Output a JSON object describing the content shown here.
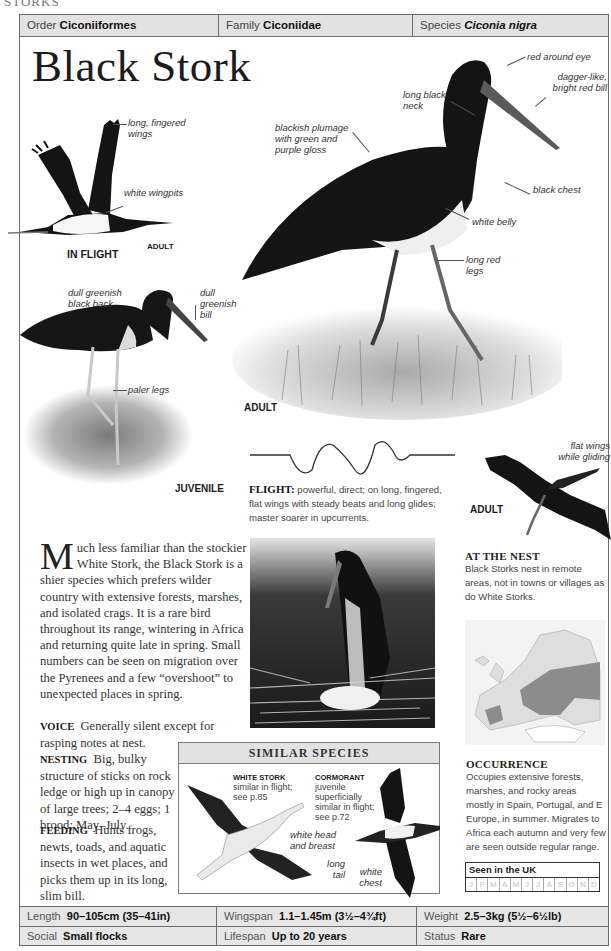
{
  "running_head": "STORKS",
  "header": {
    "order_label": "Order",
    "order_value": "Ciconiiformes",
    "family_label": "Family",
    "family_value": "Ciconiidae",
    "species_label": "Species",
    "species_value": "Ciconia nigra"
  },
  "title": "Black Stork",
  "in_flight": {
    "caption": "IN FLIGHT",
    "age": "ADULT",
    "labels": [
      "long, fingered wings",
      "white wingpits"
    ]
  },
  "adult_main": {
    "caption": "ADULT",
    "labels": {
      "eye": "red around eye",
      "bill": "dagger-like, bright red bill",
      "neck": "long black neck",
      "plumage": "blackish plumage with green and purple gloss",
      "chest": "black chest",
      "belly": "white belly",
      "legs": "long red legs"
    }
  },
  "juvenile": {
    "caption": "JUVENILE",
    "labels": {
      "back": "dull greenish black back",
      "bill": "dull greenish bill",
      "legs": "paler legs"
    }
  },
  "flight": {
    "heading": "FLIGHT:",
    "text": "powerful, direct; on long, fingered, flat wings with steady beats and long glides; master soarer in upcurrents."
  },
  "gliding": {
    "caption": "ADULT",
    "label": "flat wings while gliding"
  },
  "at_the_nest": {
    "heading": "AT THE NEST",
    "text": "Black Storks nest in remote areas, not in towns or villages as do White Storks."
  },
  "intro": {
    "dropcap": "M",
    "text": "uch less familiar than the stockier White Stork, the Black Stork is a shier species which prefers wilder country with extensive forests, marshes, and isolated crags. It is a rare bird throughout its range, wintering in Africa and returning quite late in spring. Small numbers can be seen on migration over the Pyrenees and a few “overshoot” to unexpected places in spring."
  },
  "voice": {
    "heading": "VOICE",
    "text": "Generally silent except for rasping notes at nest."
  },
  "nesting": {
    "heading": "NESTING",
    "text": "Big, bulky structure of sticks on rock ledge or high up in canopy of large trees; 2–4 eggs; 1 brood; May–July."
  },
  "feeding": {
    "heading": "FEEDING",
    "text": "Hunts frogs, newts, toads, and aquatic insects in wet places, and picks them up in its long, slim bill."
  },
  "similar_species": {
    "heading": "SIMILAR SPECIES",
    "white_stork": {
      "name": "WHITE STORK",
      "text": "similar in flight; see p.85",
      "label": "white head and breast"
    },
    "cormorant": {
      "name": "CORMORANT",
      "text": "juvenile superficially similar in flight; see p.72",
      "labels": [
        "long tail",
        "white chest"
      ]
    }
  },
  "occurrence": {
    "heading": "OCCURRENCE",
    "text": "Occupies extensive forests, marshes, and rocky areas mostly in Spain, Portugal, and E Europe, in summer. Migrates to Africa each autumn and very few are seen outside regular range."
  },
  "seen_in_uk": {
    "title": "Seen in the UK",
    "months": [
      "J",
      "F",
      "M",
      "A",
      "M",
      "J",
      "J",
      "A",
      "S",
      "O",
      "N",
      "D"
    ]
  },
  "footer": {
    "length_label": "Length",
    "length_value": "90–105cm (35–41in)",
    "wingspan_label": "Wingspan",
    "wingspan_value": "1.1–1.45m (3½–4¾ft)",
    "weight_label": "Weight",
    "weight_value": "2.5–3kg (5½–6½lb)",
    "social_label": "Social",
    "social_value": "Small flocks",
    "lifespan_label": "Lifespan",
    "lifespan_value": "Up to 20 years",
    "status_label": "Status",
    "status_value": "Rare"
  },
  "colors": {
    "header_bg": "#e2e2e2",
    "border": "#6d6d6d",
    "bird_black": "#151515",
    "map_range": "#8c8c8c"
  }
}
